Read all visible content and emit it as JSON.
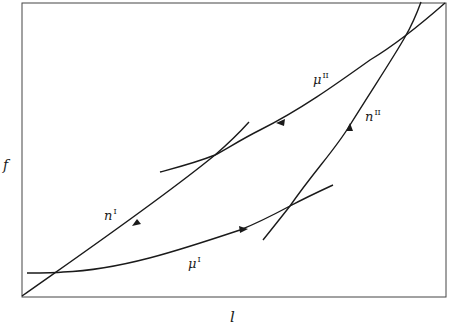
{
  "diagram": {
    "type": "phase-diagram",
    "axes": {
      "xlabel": "l",
      "ylabel": "f"
    },
    "curves": [
      {
        "id": "mu_II",
        "label": "μ",
        "superscript": "II",
        "direction": "leftward"
      },
      {
        "id": "n_II",
        "label": "n",
        "superscript": "II",
        "direction": "upward"
      },
      {
        "id": "n_I",
        "label": "n",
        "superscript": "I",
        "direction": "downward"
      },
      {
        "id": "mu_I",
        "label": "μ",
        "superscript": "I",
        "direction": "rightward"
      }
    ],
    "colors": {
      "line": "#1a1a1a",
      "background": "#ffffff"
    }
  }
}
